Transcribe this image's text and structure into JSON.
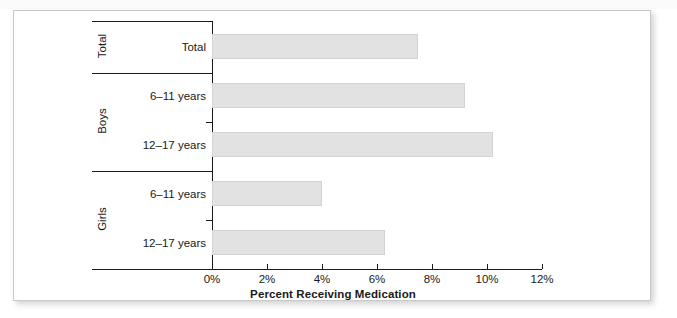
{
  "chart_data": {
    "type": "bar",
    "orientation": "horizontal",
    "title": "",
    "xlabel": "Percent Receiving Medication",
    "ylabel": "",
    "xlim": [
      0,
      12
    ],
    "grid": false,
    "legend": null,
    "xtick_labels": [
      "0%",
      "2%",
      "4%",
      "6%",
      "8%",
      "10%",
      "12%"
    ],
    "xtick_values": [
      0,
      2,
      4,
      6,
      8,
      10,
      12
    ],
    "groups": [
      {
        "group_label": "Total",
        "categories": [
          "Total"
        ],
        "values": [
          7.5
        ]
      },
      {
        "group_label": "Boys",
        "categories": [
          "6–11 years",
          "12–17 years"
        ],
        "values": [
          9.2,
          10.2
        ]
      },
      {
        "group_label": "Girls",
        "categories": [
          "6–11 years",
          "12–17 years"
        ],
        "values": [
          4.0,
          6.3
        ]
      }
    ],
    "categories": [
      "Total",
      "Boys 6–11 years",
      "Boys 12–17 years",
      "Girls 6–11 years",
      "Girls 12–17 years"
    ],
    "values": [
      7.5,
      9.2,
      10.2,
      4.0,
      6.3
    ],
    "bar_color": "#e2e2e2",
    "bar_edge_color": "#d3d3d3",
    "axis_color": "#1a1a1a",
    "background_color": "#ffffff"
  },
  "figure": {
    "card_border_color": "#c9c9c9"
  },
  "top_strip": {
    "ghost_text": ""
  }
}
